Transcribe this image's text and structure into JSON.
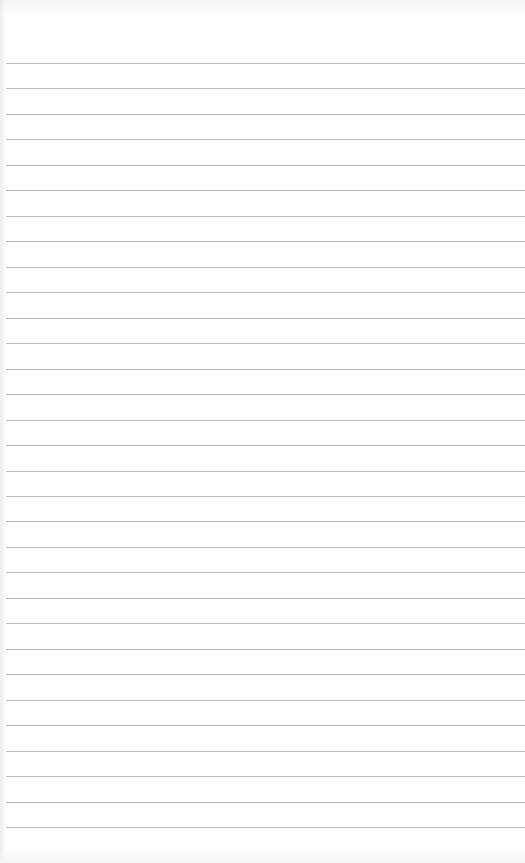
{
  "document": {
    "type": "lined-paper",
    "rule_count": 31,
    "first_rule_y": 63,
    "rule_spacing": 25.47,
    "rule_color": "#b9b9b9",
    "paper_color": "#fefefe"
  }
}
